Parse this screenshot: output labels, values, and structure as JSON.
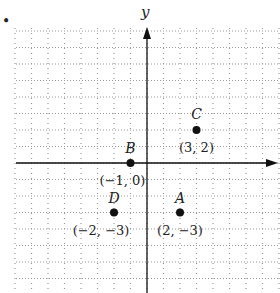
{
  "diagram": {
    "type": "coordinate-grid",
    "bullet": "•",
    "axes": {
      "x_label": "",
      "y_label": "y"
    },
    "grid": {
      "xmin": -8,
      "xmax": 8,
      "ymin": -8,
      "ymax": 8,
      "step": 1
    },
    "points": [
      {
        "name": "A",
        "x": 2,
        "y": -3,
        "label": "(2, −3)"
      },
      {
        "name": "B",
        "x": -1,
        "y": 0,
        "label": "(−1, 0)"
      },
      {
        "name": "C",
        "x": 3,
        "y": 2,
        "label": "(3, 2)"
      },
      {
        "name": "D",
        "x": -2,
        "y": -3,
        "label": "(−2, −3)"
      }
    ]
  },
  "chart_data": {
    "type": "scatter",
    "title": "",
    "xlabel": "",
    "ylabel": "y",
    "points": [
      {
        "name": "A",
        "x": 2,
        "y": -3
      },
      {
        "name": "B",
        "x": -1,
        "y": 0
      },
      {
        "name": "C",
        "x": 3,
        "y": 2
      },
      {
        "name": "D",
        "x": -2,
        "y": -3
      }
    ],
    "grid": true,
    "xlim": [
      -8,
      8
    ],
    "ylim": [
      -8,
      8
    ]
  },
  "colors": {
    "ink": "#111111",
    "grid": "#9a9a9a",
    "background": "#ffffff"
  }
}
